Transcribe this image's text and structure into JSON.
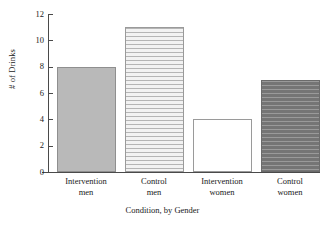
{
  "chart_data": {
    "type": "bar",
    "title": "",
    "xlabel": "Condition, by Gender",
    "ylabel": "# of Drinks",
    "categories": [
      "Intervention men",
      "Control men",
      "Intervention women",
      "Control women"
    ],
    "category_lines": [
      [
        "Intervention",
        "men"
      ],
      [
        "Control",
        "men"
      ],
      [
        "Intervention",
        "women"
      ],
      [
        "Control",
        "women"
      ]
    ],
    "values": [
      8,
      11,
      4,
      7
    ],
    "ylim": [
      0,
      12
    ],
    "yticks": [
      0,
      2,
      4,
      6,
      8,
      10,
      12
    ],
    "ytick_labels": [
      "0",
      "2",
      "4",
      "6",
      "8",
      "10",
      "12"
    ],
    "grid": false,
    "legend": "none",
    "bar_styles": [
      "solid-gray",
      "horizontal-stripes",
      "blank-white",
      "crosshatch-dark"
    ],
    "colors": {
      "axis": "#4a4a4a",
      "text": "#1a1a1a",
      "bar_solid": "#b9b9b9",
      "bar_stripe_bg": "#f0f0f0",
      "bar_stripe_line": "#b5b5b5",
      "bar_blank": "#ffffff",
      "bar_crosshatch": "#7d7d7d",
      "background": "#ffffff"
    }
  }
}
